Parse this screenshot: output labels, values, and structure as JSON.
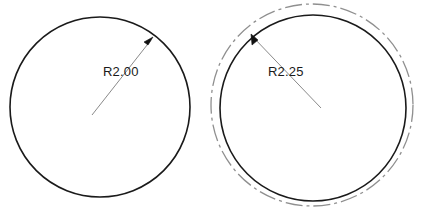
{
  "drawing": {
    "title": "circle-radius-comparison",
    "background_color": "#ffffff",
    "figures": [
      {
        "id": "left-figure",
        "name": "circle-r200",
        "circles": [
          {
            "role": "solid-outline",
            "style": "solid",
            "color": "#1a1a1a",
            "stroke_width": 1.6,
            "cx": 100,
            "cy": 107,
            "r": 90
          }
        ],
        "leader": {
          "color": "#8a8a8a",
          "stroke_width": 1,
          "from_x": 92,
          "from_y": 115,
          "to_x": 151,
          "to_y": 40,
          "arrow_color": "#111111"
        },
        "label": {
          "text": "R2.00",
          "x": 103,
          "y": 76,
          "color": "#1a1a1a"
        }
      },
      {
        "id": "right-figure",
        "name": "circle-r225",
        "circles": [
          {
            "role": "dashed-offset-outline",
            "style": "dash-dot",
            "color": "#8f8f8f",
            "stroke_width": 1.3,
            "cx": 312,
            "cy": 105,
            "r": 101
          },
          {
            "role": "solid-outline",
            "style": "solid",
            "color": "#1a1a1a",
            "stroke_width": 1.6,
            "cx": 313,
            "cy": 108,
            "r": 93
          }
        ],
        "leader": {
          "color": "#8a8a8a",
          "stroke_width": 1,
          "from_x": 321,
          "from_y": 108,
          "to_x": 253,
          "to_y": 37,
          "arrow_color": "#111111"
        },
        "label": {
          "text": "R2.25",
          "x": 268,
          "y": 76,
          "color": "#1a1a1a"
        }
      }
    ]
  }
}
